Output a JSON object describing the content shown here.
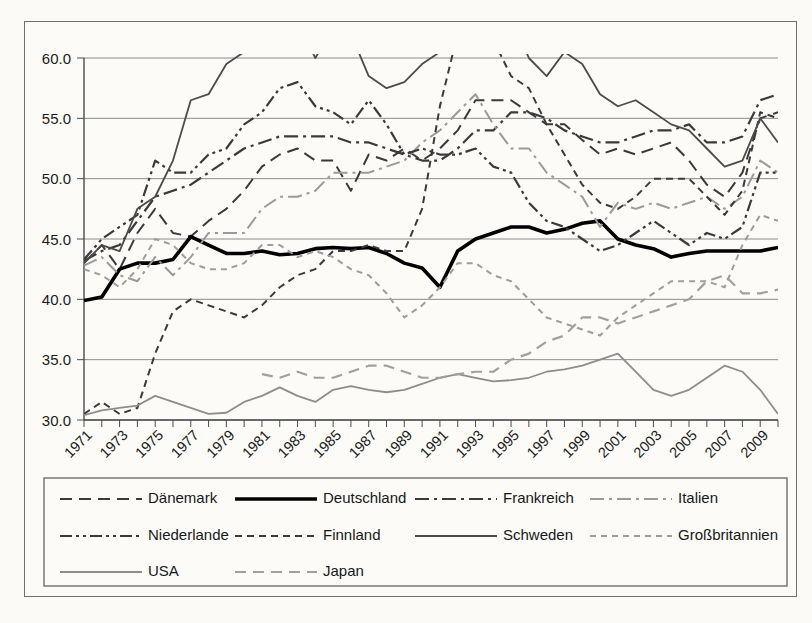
{
  "chart_data": {
    "type": "line",
    "title": "",
    "xlabel": "",
    "ylabel": "",
    "ylim": [
      30.0,
      60.0
    ],
    "ytick_labels": [
      "60.0",
      "55.0",
      "50.0",
      "45.0",
      "40.0",
      "35.0",
      "30.0"
    ],
    "ytick_values": [
      60.0,
      55.0,
      50.0,
      45.0,
      40.0,
      35.0,
      30.0
    ],
    "grid": true,
    "legend_position": "bottom",
    "x_start": 1971,
    "x_end": 2010,
    "x": [
      1971,
      1972,
      1973,
      1974,
      1975,
      1976,
      1977,
      1978,
      1979,
      1980,
      1981,
      1982,
      1983,
      1984,
      1985,
      1986,
      1987,
      1988,
      1989,
      1990,
      1991,
      1992,
      1993,
      1994,
      1995,
      1996,
      1997,
      1998,
      1999,
      2000,
      2001,
      2002,
      2003,
      2004,
      2005,
      2006,
      2007,
      2008,
      2009,
      2010
    ],
    "xtick_labels": [
      "1971",
      "1973",
      "1975",
      "1977",
      "1979",
      "1981",
      "1983",
      "1985",
      "1987",
      "1989",
      "1991",
      "1993",
      "1995",
      "1997",
      "1999",
      "2001",
      "2003",
      "2005",
      "2007",
      "2009"
    ],
    "series": [
      {
        "name": "Dänemark",
        "color": "#3a3a3a",
        "width": 2.0,
        "dash": "12,7",
        "values": [
          43.0,
          44.5,
          42.5,
          45.5,
          47.5,
          45.5,
          45.2,
          46.5,
          47.5,
          49.0,
          51.0,
          52.0,
          52.5,
          51.5,
          51.5,
          49.0,
          52.0,
          51.5,
          52.5,
          51.5,
          52.5,
          54.0,
          56.5,
          56.5,
          56.5,
          55.5,
          54.5,
          54.5,
          53.2,
          52.0,
          52.5,
          52.0,
          52.5,
          53.0,
          51.5,
          49.5,
          48.5,
          50.5,
          55.0,
          55.5
        ]
      },
      {
        "name": "Deutschland",
        "color": "#000000",
        "width": 3.6,
        "dash": "none",
        "values": [
          39.9,
          40.2,
          42.5,
          43.0,
          43.0,
          43.3,
          45.2,
          44.5,
          43.8,
          43.8,
          44.0,
          43.7,
          43.8,
          44.2,
          44.3,
          44.2,
          44.3,
          43.8,
          43.0,
          42.6,
          41.0,
          44.0,
          45.0,
          45.5,
          46.0,
          46.0,
          45.5,
          45.8,
          46.3,
          46.5,
          45.0,
          44.5,
          44.2,
          43.5,
          43.8,
          44.0,
          44.0,
          44.0,
          44.0,
          44.3
        ]
      },
      {
        "name": "Frankreich",
        "color": "#3a3a3a",
        "width": 2.2,
        "dash": "14,5,3,5",
        "values": [
          43.2,
          44.0,
          44.5,
          46.5,
          48.5,
          49.0,
          49.5,
          50.5,
          51.5,
          52.5,
          53.0,
          53.5,
          53.5,
          53.5,
          53.5,
          53.0,
          53.0,
          52.5,
          52.0,
          51.5,
          51.5,
          52.5,
          54.0,
          54.0,
          55.5,
          55.5,
          55.0,
          54.0,
          53.5,
          53.0,
          53.0,
          53.5,
          54.0,
          54.0,
          54.5,
          53.0,
          53.0,
          53.5,
          56.5,
          57.0
        ]
      },
      {
        "name": "Italien",
        "color": "#9a9a9a",
        "width": 2.0,
        "dash": "14,5,3,5",
        "values": [
          42.8,
          43.5,
          42.0,
          41.5,
          43.5,
          42.0,
          43.5,
          45.5,
          45.5,
          45.5,
          47.5,
          48.5,
          48.5,
          49.0,
          50.5,
          50.5,
          50.5,
          51.0,
          51.5,
          53.0,
          54.0,
          55.5,
          57.0,
          54.5,
          52.5,
          52.5,
          50.5,
          49.5,
          48.5,
          46.0,
          48.0,
          47.5,
          48.0,
          47.5,
          48.0,
          48.5,
          47.5,
          48.5,
          51.5,
          50.5
        ]
      },
      {
        "name": "Niederlande",
        "color": "#3a3a3a",
        "width": 2.2,
        "dash": "12,4,3,4,3,4",
        "values": [
          43.3,
          45.0,
          46.0,
          47.0,
          51.5,
          50.5,
          50.5,
          52.0,
          52.5,
          54.5,
          55.5,
          57.5,
          58.0,
          56.0,
          55.5,
          54.5,
          56.5,
          54.5,
          52.0,
          52.5,
          52.0,
          52.0,
          52.5,
          51.0,
          50.5,
          48.0,
          46.5,
          46.0,
          45.0,
          44.0,
          44.5,
          45.5,
          46.5,
          45.5,
          44.5,
          45.5,
          45.0,
          46.0,
          50.5,
          50.5
        ]
      },
      {
        "name": "Finnland",
        "color": "#3a3a3a",
        "width": 2.0,
        "dash": "7,5",
        "values": [
          30.5,
          31.5,
          30.5,
          31.0,
          35.5,
          39.0,
          40.0,
          39.5,
          39.0,
          38.5,
          39.5,
          41.0,
          42.0,
          42.5,
          44.0,
          44.0,
          44.5,
          44.0,
          44.0,
          47.5,
          56.0,
          62.0,
          63.5,
          61.5,
          58.5,
          57.5,
          54.5,
          52.0,
          49.5,
          48.0,
          47.5,
          48.5,
          50.0,
          50.0,
          50.0,
          48.5,
          47.0,
          49.0,
          55.5,
          55.0
        ]
      },
      {
        "name": "Schweden",
        "color": "#4b4b4b",
        "width": 1.8,
        "dash": "none",
        "values": [
          43.0,
          44.5,
          44.0,
          47.5,
          48.5,
          51.5,
          56.5,
          57.0,
          59.5,
          60.5,
          62.0,
          64.0,
          63.0,
          60.0,
          62.5,
          62.0,
          58.5,
          57.5,
          58.0,
          59.5,
          60.5,
          67.0,
          70.0,
          67.5,
          63.5,
          60.0,
          58.5,
          60.5,
          59.5,
          57.0,
          56.0,
          56.5,
          55.5,
          54.5,
          54.0,
          52.5,
          51.0,
          51.5,
          55.0,
          53.0
        ]
      },
      {
        "name": "Großbritannien",
        "color": "#9d9d9d",
        "width": 2.0,
        "dash": "6,5"
      },
      {
        "name": "USA",
        "color": "#8d8d8d",
        "width": 1.8,
        "dash": "none",
        "values": [
          30.4,
          30.8,
          31.0,
          31.2,
          32.0,
          31.5,
          31.0,
          30.5,
          30.6,
          31.5,
          32.0,
          32.7,
          32.0,
          31.5,
          32.5,
          32.8,
          32.5,
          32.3,
          32.5,
          33.0,
          33.5,
          33.8,
          33.5,
          33.2,
          33.3,
          33.5,
          34.0,
          34.2,
          34.5,
          35.0,
          35.5,
          34.0,
          32.5,
          32.0,
          32.5,
          33.5,
          34.5,
          34.0,
          32.5,
          30.5
        ]
      },
      {
        "name": "Japan",
        "color": "#a0a0a0",
        "width": 2.2,
        "dash": "11,7",
        "values": [
          null,
          null,
          null,
          null,
          null,
          null,
          null,
          null,
          null,
          null,
          33.8,
          33.5,
          34.0,
          33.5,
          33.5,
          34.0,
          34.5,
          34.5,
          34.0,
          33.5,
          33.5,
          33.8,
          34.0,
          34.0,
          35.0,
          35.5,
          36.5,
          37.0,
          38.5,
          38.5,
          38.0,
          38.5,
          39.0,
          39.5,
          40.0,
          41.5,
          42.0,
          40.5,
          40.5,
          40.8
        ]
      }
    ],
    "gb_values": [
      42.5,
      42.0,
      41.0,
      42.5,
      45.0,
      44.5,
      43.0,
      42.5,
      42.5,
      43.0,
      44.5,
      44.5,
      43.5,
      44.0,
      43.5,
      42.5,
      42.0,
      40.5,
      38.5,
      39.5,
      41.0,
      43.0,
      43.0,
      42.0,
      41.5,
      40.0,
      38.5,
      38.0,
      37.5,
      37.0,
      38.5,
      39.5,
      40.5,
      41.5,
      41.5,
      41.5,
      41.0,
      44.5,
      47.0,
      46.5
    ],
    "jp_values": [
      null,
      null,
      null,
      null,
      null,
      null,
      null,
      null,
      null,
      null,
      33.8,
      33.5,
      34.0,
      33.5,
      33.5,
      34.0,
      34.5,
      34.5,
      34.0,
      33.5,
      33.5,
      33.8,
      34.0,
      34.0,
      35.0,
      35.5,
      36.5,
      37.0,
      38.5,
      38.5,
      38.0,
      38.5,
      39.0,
      39.5,
      40.0,
      41.5,
      42.0,
      40.5,
      40.5,
      40.8
    ]
  },
  "legend": {
    "entries": [
      {
        "label": "Dänemark",
        "color": "#3a3a3a",
        "width": 2.0,
        "dash": "12,7"
      },
      {
        "label": "Deutschland",
        "color": "#000000",
        "width": 3.6,
        "dash": "none"
      },
      {
        "label": "Frankreich",
        "color": "#3a3a3a",
        "width": 2.2,
        "dash": "14,5,3,5"
      },
      {
        "label": "Italien",
        "color": "#9a9a9a",
        "width": 2.0,
        "dash": "14,5,3,5"
      },
      {
        "label": "Niederlande",
        "color": "#3a3a3a",
        "width": 2.2,
        "dash": "12,4,3,4,3,4"
      },
      {
        "label": "Finnland",
        "color": "#3a3a3a",
        "width": 2.0,
        "dash": "7,5"
      },
      {
        "label": "Schweden",
        "color": "#4b4b4b",
        "width": 1.8,
        "dash": "none"
      },
      {
        "label": "Großbritannien",
        "color": "#9d9d9d",
        "width": 2.0,
        "dash": "6,5"
      },
      {
        "label": "USA",
        "color": "#8d8d8d",
        "width": 1.8,
        "dash": "none"
      },
      {
        "label": "Japan",
        "color": "#a0a0a0",
        "width": 2.2,
        "dash": "11,7"
      }
    ]
  }
}
